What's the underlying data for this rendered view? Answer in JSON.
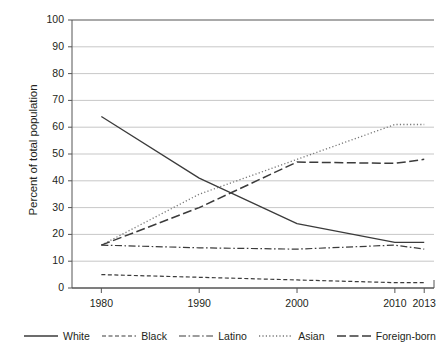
{
  "chart_data": {
    "type": "line",
    "title": "",
    "xlabel": "",
    "ylabel": "Percent of total population",
    "x": [
      1980,
      1990,
      2000,
      2010,
      2013
    ],
    "categories": [
      "1980",
      "1990",
      "2000",
      "2010",
      "2013"
    ],
    "xlim": [
      1977,
      2014
    ],
    "ylim": [
      0,
      100
    ],
    "ytick_labels": [
      "0",
      "10",
      "20",
      "30",
      "40",
      "50",
      "60",
      "70",
      "80",
      "90",
      "100"
    ],
    "yticks": [
      0,
      10,
      20,
      30,
      40,
      50,
      60,
      70,
      80,
      90,
      100
    ],
    "grid": "horizontal",
    "legend_position": "bottom",
    "series": [
      {
        "name": "White",
        "style": "solid",
        "color": "#3b3b3b",
        "values": [
          64,
          41,
          24,
          17,
          17
        ]
      },
      {
        "name": "Black",
        "style": "dashed",
        "color": "#3b3b3b",
        "values": [
          5,
          4,
          3,
          2,
          2
        ]
      },
      {
        "name": "Latino",
        "style": "dash-dot",
        "color": "#3b3b3b",
        "values": [
          16,
          15,
          14.5,
          16,
          14.5
        ]
      },
      {
        "name": "Asian",
        "style": "dotted",
        "color": "#777777",
        "values": [
          16,
          35,
          48,
          61,
          61
        ]
      },
      {
        "name": "Foreign-born",
        "style": "long-dash",
        "color": "#3b3b3b",
        "values": [
          16,
          30,
          47,
          46.5,
          48
        ]
      }
    ]
  },
  "axes": {
    "y_title": "Percent of total population"
  },
  "legend": {
    "items": [
      {
        "label": "White",
        "style": "solid"
      },
      {
        "label": "Black",
        "style": "dashed"
      },
      {
        "label": "Latino",
        "style": "dash-dot"
      },
      {
        "label": "Asian",
        "style": "dotted"
      },
      {
        "label": "Foreign-born",
        "style": "long-dash"
      }
    ]
  }
}
